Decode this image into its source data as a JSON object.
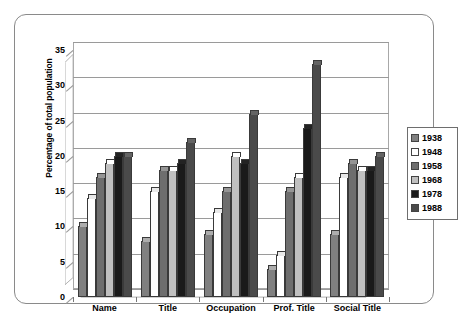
{
  "chart_data": {
    "type": "bar",
    "title": "",
    "subtitle": "",
    "xlabel": "",
    "ylabel": "Percentage of total population",
    "categories": [
      "Name",
      "Title",
      "Occupation",
      "Prof. Title",
      "Social Title"
    ],
    "series": [
      {
        "name": "1938",
        "color": "#808080",
        "values": [
          10,
          8,
          9,
          4,
          9
        ]
      },
      {
        "name": "1948",
        "color": "#ffffff",
        "values": [
          14,
          15,
          12,
          6,
          17
        ]
      },
      {
        "name": "1958",
        "color": "#6e6e6e",
        "values": [
          17,
          18,
          15,
          15,
          19
        ]
      },
      {
        "name": "1968",
        "color": "#c0c0c0",
        "values": [
          19,
          18,
          20,
          17,
          18
        ]
      },
      {
        "name": "1978",
        "color": "#1a1a1a",
        "values": [
          20,
          19,
          19,
          24,
          18
        ]
      },
      {
        "name": "1988",
        "color": "#4a4a4a",
        "values": [
          20,
          22,
          26,
          33,
          20
        ]
      }
    ],
    "ylim": [
      0,
      35
    ],
    "ytick_labels": [
      "0",
      "5",
      "10",
      "15",
      "20",
      "25",
      "30",
      "35"
    ],
    "ytick_values": [
      0,
      5,
      10,
      15,
      20,
      25,
      30,
      35
    ],
    "grid": true,
    "legend_position": "right",
    "three_d": true
  },
  "legend": {
    "entries": [
      {
        "label": "1938",
        "color": "#808080"
      },
      {
        "label": "1948",
        "color": "#ffffff"
      },
      {
        "label": "1958",
        "color": "#6e6e6e"
      },
      {
        "label": "1968",
        "color": "#c0c0c0"
      },
      {
        "label": "1978",
        "color": "#1a1a1a"
      },
      {
        "label": "1988",
        "color": "#4a4a4a"
      }
    ]
  }
}
